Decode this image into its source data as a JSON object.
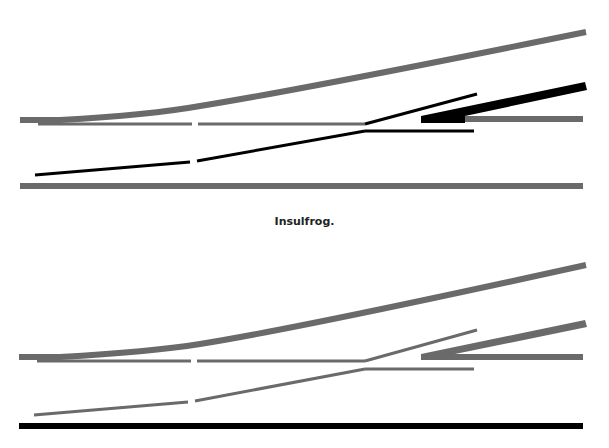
{
  "caption": "Insulfrog.",
  "colors": {
    "gray": "#6a6a6a",
    "black": "#000000",
    "background": "#ffffff"
  },
  "diagrams": [
    {
      "name": "top-turnout",
      "energized_rail_color": "black",
      "description": "Diverging closure rail, frog point rails and outer wing rail shown black; through-route rails shown gray"
    },
    {
      "name": "bottom-turnout",
      "energized_rail_color": "gray",
      "description": "All turnout rails gray; straight stock rail shown black"
    }
  ]
}
